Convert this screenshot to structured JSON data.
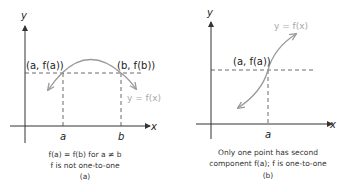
{
  "panel_a": {
    "y_axis_label": "y",
    "x_axis_label": "x",
    "point_a_label": "(a, f(a))",
    "point_b_label": "(b, f(b))",
    "curve_label": "y = f(x)",
    "tick_a": "a",
    "tick_b": "b",
    "caption_line1": "f(a) = f(b) for a ≠ b",
    "caption_line2": "f is not one-to-one",
    "caption_line3": "(a)"
  },
  "panel_b": {
    "y_axis_label": "y",
    "x_axis_label": "x",
    "point_a_label": "(a, f(a))",
    "curve_label": "y = f(x)",
    "tick_a": "a",
    "caption_line1": "Only one point has second",
    "caption_line2": "component f(a); f is one-to-one",
    "caption_line3": "(b)"
  },
  "colors": {
    "axis": "#333333",
    "curve": "#9a9a9a",
    "dashed": "#444444",
    "curve_label": "#a8a8a8"
  }
}
